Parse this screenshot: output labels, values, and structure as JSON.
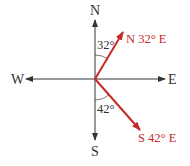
{
  "diagram": {
    "type": "compass-bearings",
    "directions": {
      "north": "N",
      "south": "S",
      "east": "E",
      "west": "W"
    },
    "bearings": [
      {
        "label": "N 32° E",
        "angle_label": "32°",
        "angle_deg": 32,
        "from": "N",
        "toward": "E"
      },
      {
        "label": "S 42° E",
        "angle_label": "42°",
        "angle_deg": 42,
        "from": "S",
        "toward": "E"
      }
    ],
    "colors": {
      "axis": "#333333",
      "bearing": "#c62828",
      "text": "#333333"
    }
  }
}
